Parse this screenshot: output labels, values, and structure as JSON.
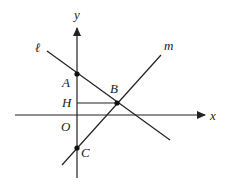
{
  "diagram": {
    "type": "coordinate-geometry",
    "axes": {
      "x_label": "x",
      "y_label": "y",
      "origin_label": "O"
    },
    "lines": [
      {
        "name": "ℓ",
        "description": "line with negative slope through A and B"
      },
      {
        "name": "m",
        "description": "line with positive slope through C and B"
      }
    ],
    "points": [
      {
        "label": "A",
        "description": "y-intercept of line ℓ"
      },
      {
        "label": "B",
        "description": "intersection of ℓ and m"
      },
      {
        "label": "C",
        "description": "y-intercept of line m"
      },
      {
        "label": "H",
        "description": "foot of perpendicular from B to y-axis"
      }
    ],
    "colors": {
      "stroke": "#222222",
      "background": "#ffffff"
    }
  },
  "labels": {
    "x": "x",
    "y": "y",
    "O": "O",
    "A": "A",
    "B": "B",
    "C": "C",
    "H": "H",
    "l": "ℓ",
    "m": "m"
  }
}
